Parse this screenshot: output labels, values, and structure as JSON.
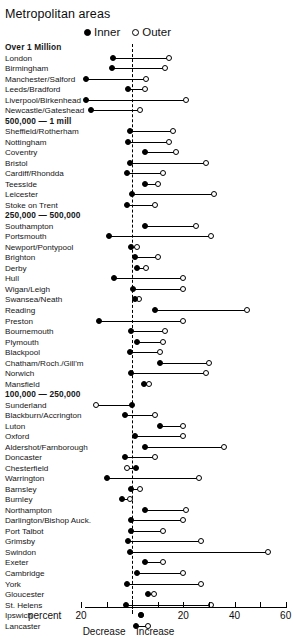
{
  "title": "Metropolitan areas",
  "legend": {
    "position": "top-center",
    "items": [
      {
        "label": "Inner",
        "marker": "filled-circle-icon",
        "color": "#000000"
      },
      {
        "label": "Outer",
        "marker": "hollow-circle-icon",
        "color": "#000000"
      }
    ]
  },
  "axis": {
    "unit_label": "percent",
    "left_direction_label": "Decrease",
    "right_direction_label": "Increase",
    "ticks": [
      {
        "value": -20,
        "label": "20"
      },
      {
        "value": -10,
        "label": ""
      },
      {
        "value": 0,
        "label": ""
      },
      {
        "value": 10,
        "label": ""
      },
      {
        "value": 20,
        "label": "20"
      },
      {
        "value": 30,
        "label": ""
      },
      {
        "value": 40,
        "label": "40"
      },
      {
        "value": 50,
        "label": ""
      },
      {
        "value": 60,
        "label": "60"
      }
    ],
    "xlim": [
      -20,
      60
    ],
    "zero_reference": 0
  },
  "chart_data": {
    "type": "scatter",
    "title": "Metropolitan areas",
    "xlabel": "percent",
    "ylabel": "",
    "xlim": [
      -20,
      60
    ],
    "grid": false,
    "legend_position": "top-center",
    "series": [
      {
        "name": "Inner",
        "marker": "filled-circle"
      },
      {
        "name": "Outer",
        "marker": "hollow-circle"
      }
    ],
    "rows": [
      {
        "label": "Over 1 Million",
        "group": true
      },
      {
        "label": "London",
        "inner": -7.5,
        "outer": 14.5
      },
      {
        "label": "Birmingham",
        "inner": -8,
        "outer": 13
      },
      {
        "label": "Manchester/Salford",
        "inner": -18,
        "outer": 5.5
      },
      {
        "label": "Leeds/Bradford",
        "inner": -1.5,
        "outer": 5
      },
      {
        "label": "Liverpool/Birkenhead",
        "inner": -18,
        "outer": 21
      },
      {
        "label": "Newcastle/Gateshead",
        "inner": -16,
        "outer": 3
      },
      {
        "label": "500,000 — 1 mill",
        "group": true
      },
      {
        "label": "Sheffield/Rotherham",
        "inner": -1,
        "outer": 16
      },
      {
        "label": "Nottingham",
        "inner": -1.5,
        "outer": 14.5
      },
      {
        "label": "Coventry",
        "inner": 5,
        "outer": 17
      },
      {
        "label": "Bristol",
        "inner": -1,
        "outer": 29
      },
      {
        "label": "Cardiff/Rhondda",
        "inner": -2,
        "outer": 12
      },
      {
        "label": "Teesside",
        "inner": 5,
        "outer": 10
      },
      {
        "label": "Leicester",
        "inner": 0,
        "outer": 32
      },
      {
        "label": "Stoke on Trent",
        "inner": -2,
        "outer": 9
      },
      {
        "label": "250,000 — 500,000",
        "group": true
      },
      {
        "label": "Southampton",
        "inner": 5,
        "outer": 25
      },
      {
        "label": "Portsmouth",
        "inner": -9,
        "outer": 31
      },
      {
        "label": "Newport/Pontypool",
        "inner": -0.5,
        "outer": 2
      },
      {
        "label": "Brighton",
        "inner": 1,
        "outer": 10
      },
      {
        "label": "Derby",
        "inner": 2,
        "outer": 5.5
      },
      {
        "label": "Hull",
        "inner": -7,
        "outer": 20
      },
      {
        "label": "Wigan/Leigh",
        "inner": 0.5,
        "outer": 20
      },
      {
        "label": "Swansea/Neath",
        "inner": 1,
        "outer": 2.5
      },
      {
        "label": "Reading",
        "inner": 9,
        "outer": 45
      },
      {
        "label": "Preston",
        "inner": -13,
        "outer": 20
      },
      {
        "label": "Bournemouth",
        "inner": -0.5,
        "outer": 13
      },
      {
        "label": "Plymouth",
        "inner": 2,
        "outer": 12
      },
      {
        "label": "Blackpool",
        "inner": -1,
        "outer": 11
      },
      {
        "label": "Chatham/Roch./Gill'm",
        "inner": 11,
        "outer": 30
      },
      {
        "label": "Norwich",
        "inner": -0.5,
        "outer": 29
      },
      {
        "label": "Mansfield",
        "inner": 4.5,
        "outer": 6.5
      },
      {
        "label": "100,000 — 250,000",
        "group": true
      },
      {
        "label": "Sunderland",
        "inner": 0,
        "outer": -14
      },
      {
        "label": "Blackburn/Accrington",
        "inner": -3,
        "outer": 9
      },
      {
        "label": "Luton",
        "inner": 11,
        "outer": 20
      },
      {
        "label": "Oxford",
        "inner": 1,
        "outer": 20
      },
      {
        "label": "Aldershot/Farnborough",
        "inner": 5,
        "outer": 36
      },
      {
        "label": "Doncaster",
        "inner": -3,
        "outer": 9
      },
      {
        "label": "Chesterfield",
        "inner": 1.5,
        "outer": -2
      },
      {
        "label": "Warrington",
        "inner": -10,
        "outer": 26
      },
      {
        "label": "Barnsley",
        "inner": -0.5,
        "outer": 3
      },
      {
        "label": "Burnley",
        "inner": -4,
        "outer": -1
      },
      {
        "label": "Northampton",
        "inner": 5,
        "outer": 21
      },
      {
        "label": "Darlington/Bishop Auck.",
        "inner": -0.5,
        "outer": 20
      },
      {
        "label": "Port Talbot",
        "inner": -0.5,
        "outer": 12
      },
      {
        "label": "Grimsby",
        "inner": -1.5,
        "outer": 27
      },
      {
        "label": "Swindon",
        "inner": -1,
        "outer": 53
      },
      {
        "label": "Exeter",
        "inner": 5,
        "outer": 12
      },
      {
        "label": "Cambridge",
        "inner": 2,
        "outer": 20
      },
      {
        "label": "York",
        "inner": -2,
        "outer": 27
      },
      {
        "label": "Gloucester",
        "inner": 6,
        "outer": 8.5
      },
      {
        "label": "St. Helens",
        "inner": -2.5,
        "outer": 31
      },
      {
        "label": "Ipswich",
        "inner": 3.5,
        "outer": 3.5
      },
      {
        "label": "Lancaster",
        "inner": 1.5,
        "outer": 6
      }
    ]
  }
}
